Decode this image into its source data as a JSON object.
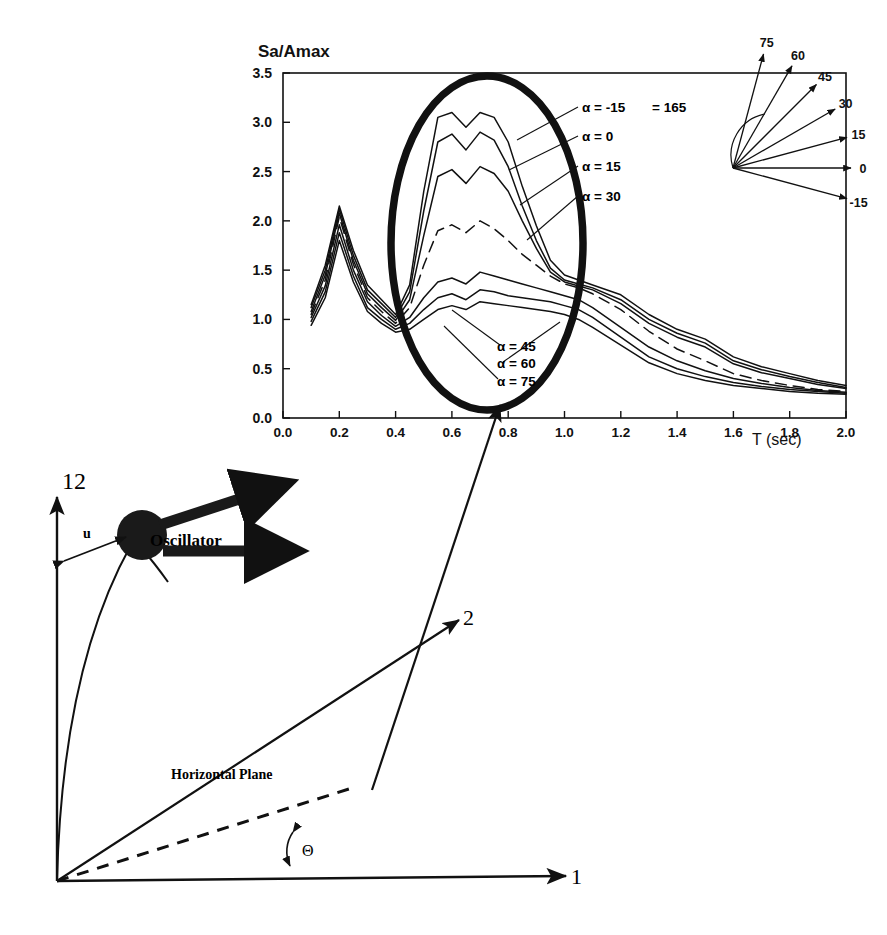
{
  "figure": {
    "name": "response-spectrum-and-oscillator-orientation-figure"
  },
  "chart_data": {
    "type": "line",
    "title": "",
    "ylabel": "Sa/Amax",
    "xlabel": "T (sec)",
    "xlim": [
      0.0,
      2.0
    ],
    "ylim": [
      0.0,
      3.5
    ],
    "xticks": [
      "0.0",
      "0.2",
      "0.4",
      "0.6",
      "0.8",
      "1.0",
      "1.2",
      "1.4",
      "1.6",
      "1.8",
      "2.0"
    ],
    "yticks": [
      "0.0",
      "0.5",
      "1.0",
      "1.5",
      "2.0",
      "2.5",
      "3.0",
      "3.5"
    ],
    "grid": false,
    "legend_position": "inline-right-annotations",
    "x": [
      0.1,
      0.15,
      0.2,
      0.25,
      0.3,
      0.35,
      0.4,
      0.45,
      0.5,
      0.55,
      0.6,
      0.65,
      0.7,
      0.75,
      0.8,
      0.85,
      0.9,
      0.95,
      1.0,
      1.05,
      1.1,
      1.2,
      1.3,
      1.4,
      1.5,
      1.6,
      1.7,
      1.8,
      1.9,
      2.0
    ],
    "series": [
      {
        "name": "α = -15  = 165",
        "style": "solid",
        "values": [
          1.15,
          1.55,
          2.15,
          1.7,
          1.35,
          1.2,
          1.05,
          1.35,
          2.3,
          3.05,
          3.1,
          2.95,
          3.1,
          3.05,
          2.8,
          2.35,
          1.95,
          1.6,
          1.45,
          1.4,
          1.35,
          1.25,
          1.05,
          0.9,
          0.8,
          0.62,
          0.52,
          0.45,
          0.38,
          0.33
        ]
      },
      {
        "name": "α = 0",
        "style": "solid",
        "values": [
          1.12,
          1.5,
          2.12,
          1.65,
          1.3,
          1.16,
          1.02,
          1.28,
          2.1,
          2.8,
          2.88,
          2.72,
          2.9,
          2.82,
          2.55,
          2.15,
          1.8,
          1.52,
          1.4,
          1.36,
          1.32,
          1.2,
          1.0,
          0.86,
          0.76,
          0.58,
          0.49,
          0.42,
          0.36,
          0.31
        ]
      },
      {
        "name": "α = 15",
        "style": "solid",
        "values": [
          1.08,
          1.45,
          2.08,
          1.6,
          1.26,
          1.12,
          0.99,
          1.2,
          1.85,
          2.45,
          2.52,
          2.38,
          2.55,
          2.48,
          2.3,
          2.0,
          1.72,
          1.48,
          1.38,
          1.34,
          1.3,
          1.16,
          0.96,
          0.82,
          0.72,
          0.55,
          0.46,
          0.4,
          0.34,
          0.3
        ]
      },
      {
        "name": "α = 30",
        "style": "dashed",
        "values": [
          1.05,
          1.4,
          2.04,
          1.56,
          1.22,
          1.08,
          0.96,
          1.12,
          1.55,
          1.9,
          1.96,
          1.88,
          2.0,
          1.92,
          1.8,
          1.66,
          1.55,
          1.44,
          1.36,
          1.32,
          1.26,
          1.1,
          0.88,
          0.7,
          0.58,
          0.45,
          0.38,
          0.33,
          0.29,
          0.27
        ]
      },
      {
        "name": "α = 45",
        "style": "solid",
        "values": [
          1.02,
          1.34,
          1.96,
          1.5,
          1.18,
          1.04,
          0.93,
          1.02,
          1.22,
          1.38,
          1.42,
          1.36,
          1.48,
          1.44,
          1.4,
          1.36,
          1.32,
          1.28,
          1.24,
          1.2,
          1.12,
          0.92,
          0.72,
          0.58,
          0.48,
          0.4,
          0.35,
          0.31,
          0.28,
          0.26
        ]
      },
      {
        "name": "α = 60",
        "style": "solid",
        "values": [
          0.98,
          1.28,
          1.88,
          1.44,
          1.12,
          1.0,
          0.9,
          0.96,
          1.1,
          1.22,
          1.26,
          1.2,
          1.3,
          1.28,
          1.24,
          1.22,
          1.2,
          1.18,
          1.14,
          1.1,
          1.02,
          0.82,
          0.62,
          0.5,
          0.42,
          0.36,
          0.32,
          0.29,
          0.27,
          0.25
        ]
      },
      {
        "name": "α = 75",
        "style": "solid",
        "values": [
          0.94,
          1.22,
          1.8,
          1.38,
          1.08,
          0.96,
          0.87,
          0.9,
          1.0,
          1.1,
          1.14,
          1.1,
          1.18,
          1.16,
          1.14,
          1.12,
          1.1,
          1.08,
          1.05,
          1.0,
          0.92,
          0.74,
          0.56,
          0.45,
          0.38,
          0.33,
          0.3,
          0.27,
          0.25,
          0.24
        ]
      }
    ],
    "annotations": [
      {
        "name": "highlight-ellipse",
        "shape": "ellipse",
        "note": "thick oval enclosing peak region 0.45-1.05 sec"
      },
      {
        "name": "callout-arrow",
        "shape": "arrow",
        "note": "arrow from lower diagram to ellipse"
      }
    ]
  },
  "chart_labels": {
    "alpha_minus15": "α = -15",
    "alpha_minus15_alt": "= 165",
    "alpha_0": "α = 0",
    "alpha_15": "α = 15",
    "alpha_30": "α = 30",
    "alpha_45": "α = 45",
    "alpha_60": "α = 60",
    "alpha_75": "α = 75"
  },
  "compass_inset": {
    "name": "angle-fan-inset",
    "rays": [
      {
        "label": "75",
        "angle": 75
      },
      {
        "label": "60",
        "angle": 60
      },
      {
        "label": "45",
        "angle": 45
      },
      {
        "label": "30",
        "angle": 30
      },
      {
        "label": "15",
        "angle": 15
      },
      {
        "label": "0",
        "angle": 0
      },
      {
        "label": "-15",
        "angle": -15
      }
    ]
  },
  "oscillator_diagram": {
    "axis_1": "1",
    "axis_2": "2",
    "axis_12": "12",
    "displacement": "u",
    "oscillator": "Oscillator",
    "plane": "Horizontal Plane",
    "angle": "Θ"
  },
  "colors": {
    "ink": "#111111",
    "paper": "#ffffff"
  }
}
